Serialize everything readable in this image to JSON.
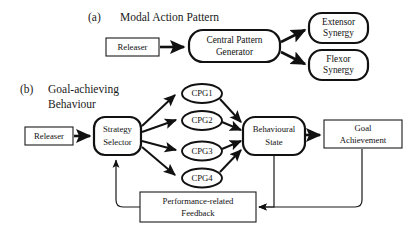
{
  "figure": {
    "background_color": "#ffffff",
    "line_color": "#111111",
    "text_color": "#1a1a1a"
  },
  "panel_a": {
    "label": "(a)",
    "caption": "Modal Action Pattern",
    "nodes": {
      "releaser": {
        "label": "Releaser",
        "shape": "rect"
      },
      "cpg": {
        "line1": "Central Pattern",
        "line2": "Generator",
        "shape": "rounded"
      },
      "extensor": {
        "line1": "Extensor",
        "line2": "Synergy",
        "shape": "rounded"
      },
      "flexor": {
        "line1": "Flexor",
        "line2": "Synergy",
        "shape": "rounded"
      }
    },
    "edges": [
      {
        "from": "releaser",
        "to": "cpg"
      },
      {
        "from": "cpg",
        "to": "extensor"
      },
      {
        "from": "cpg",
        "to": "flexor"
      }
    ]
  },
  "panel_b": {
    "label": "(b)",
    "caption_line1": "Goal-achieving",
    "caption_line2": "Behaviour",
    "nodes": {
      "releaser": {
        "label": "Releaser",
        "shape": "rect"
      },
      "strategy_selector": {
        "line1": "Strategy",
        "line2": "Selector",
        "shape": "rounded"
      },
      "cpg1": {
        "label": "CPG1",
        "shape": "ellipse"
      },
      "cpg2": {
        "label": "CPG2",
        "shape": "ellipse"
      },
      "cpg3": {
        "label": "CPG3",
        "shape": "ellipse"
      },
      "cpg4": {
        "label": "CPG4",
        "shape": "ellipse"
      },
      "behavioural_state": {
        "line1": "Behavioural",
        "line2": "State",
        "shape": "rounded"
      },
      "goal_achievement": {
        "line1": "Goal",
        "line2": "Achievement",
        "shape": "rect"
      },
      "feedback": {
        "line1": "Performance-related",
        "line2": "Feedback",
        "shape": "rect"
      }
    },
    "edges": [
      {
        "from": "releaser",
        "to": "strategy_selector"
      },
      {
        "from": "strategy_selector",
        "to": "cpg1"
      },
      {
        "from": "strategy_selector",
        "to": "cpg2"
      },
      {
        "from": "strategy_selector",
        "to": "cpg3"
      },
      {
        "from": "strategy_selector",
        "to": "cpg4"
      },
      {
        "from": "cpg1",
        "to": "behavioural_state"
      },
      {
        "from": "cpg2",
        "to": "behavioural_state"
      },
      {
        "from": "cpg3",
        "to": "behavioural_state"
      },
      {
        "from": "cpg4",
        "to": "behavioural_state"
      },
      {
        "from": "behavioural_state",
        "to": "goal_achievement"
      },
      {
        "from": "behavioural_state",
        "to": "feedback"
      },
      {
        "from": "goal_achievement",
        "to": "feedback"
      },
      {
        "from": "feedback",
        "to": "strategy_selector"
      }
    ]
  }
}
